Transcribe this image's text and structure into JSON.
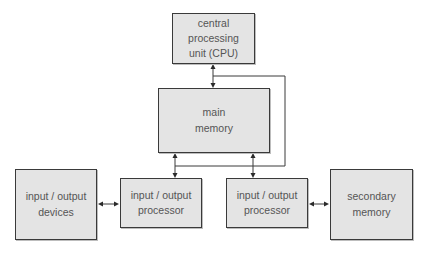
{
  "diagram": {
    "title": "",
    "nodes": [
      {
        "id": "cpu",
        "label": "central\nprocessing\nunit (CPU)"
      },
      {
        "id": "main_memory",
        "label": "main\nmemory"
      },
      {
        "id": "io_devices",
        "label": "input / output\ndevices"
      },
      {
        "id": "io_processor_1",
        "label": "input / output\nprocessor"
      },
      {
        "id": "io_processor_2",
        "label": "input / output\nprocessor"
      },
      {
        "id": "secondary_memory",
        "label": "secondary\nmemory"
      }
    ],
    "edges": [
      {
        "from": "cpu",
        "to": "main_memory",
        "type": "bidirectional"
      },
      {
        "from": "main_memory",
        "to": "io_processor_1",
        "type": "bidirectional"
      },
      {
        "from": "main_memory",
        "to": "io_processor_2",
        "type": "bidirectional"
      },
      {
        "from": "io_devices",
        "to": "io_processor_1",
        "type": "bidirectional"
      },
      {
        "from": "io_processor_2",
        "to": "secondary_memory",
        "type": "bidirectional"
      },
      {
        "from": "cpu",
        "to": "io_processor_1",
        "type": "control-line"
      },
      {
        "from": "cpu",
        "to": "io_processor_2",
        "type": "control-line"
      }
    ]
  },
  "colors": {
    "box_fill": "#e4e4e4",
    "box_border": "#3a3a3a",
    "text": "#555555",
    "line": "#3a3a3a"
  }
}
